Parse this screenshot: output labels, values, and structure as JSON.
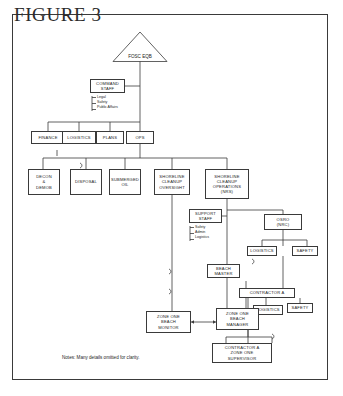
{
  "figure": {
    "title": "FIGURE 3",
    "notes": "Notes:  Many details omitted for clarity."
  },
  "nodes": {
    "fosc": {
      "line1": "FOSC",
      "line2": "EQB"
    },
    "command_staff": {
      "line1": "COMMAND",
      "line2": "STAFF"
    },
    "command_staff_bullets": {
      "b1": "Legal",
      "b2": "Safety",
      "b3": "Public Affairs"
    },
    "finance": {
      "label": "FINANCE"
    },
    "logistics_top": {
      "label": "LOGISTICS"
    },
    "plans": {
      "label": "PLANS"
    },
    "ops": {
      "label": "OPS"
    },
    "decon": {
      "line1": "DECON",
      "line2": "&",
      "line3": "DEMOB"
    },
    "disposal": {
      "label": "DISPOSAL"
    },
    "submerged_oil": {
      "line1": "SUBMERGED",
      "line2": "OIL"
    },
    "shoreline_oversight": {
      "line1": "SHORELINE",
      "line2": "CLEANUP",
      "line3": "OVERSIGHT"
    },
    "shoreline_operations": {
      "line1": "SHORELINE",
      "line2": "CLEANUP",
      "line3": "OPERATIONS",
      "line4": "(NRS)"
    },
    "support_staff": {
      "line1": "SUPPORT",
      "line2": "STAFF"
    },
    "support_staff_bullets": {
      "b1": "Safety",
      "b2": "Admin",
      "b3": "Logistics"
    },
    "osro": {
      "line1": "OSRO",
      "line2": "(NRC)"
    },
    "logistics_osro": {
      "label": "LOGISTICS"
    },
    "safety_osro": {
      "label": "SAFETY"
    },
    "beach_master": {
      "line1": "BEACH",
      "line2": "MASTER"
    },
    "contractor_a": {
      "label": "CONTRACTOR A"
    },
    "safety_contractor": {
      "label": "SAFETY"
    },
    "logistics_contractor": {
      "label": "LOGISTICS"
    },
    "zone_one_beach_monitor": {
      "line1": "ZONE ONE",
      "line2": "BEACH",
      "line3": "MONITOR"
    },
    "zone_one_beach_manager": {
      "line1": "ZONE ONE",
      "line2": "BEACH",
      "line3": "MANAGER"
    },
    "contractor_a_supervisor": {
      "line1": "CONTRACTOR A",
      "line2": "ZONE ONE",
      "line3": "SUPERVISOR"
    }
  },
  "colors": {
    "stroke": "#3a3a3a",
    "text": "#1d1d1d",
    "background": "#ffffff"
  }
}
